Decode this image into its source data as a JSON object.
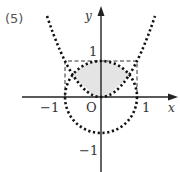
{
  "problem": {
    "number_label": "(5)"
  },
  "axes": {
    "x_label": "x",
    "y_label": "y",
    "origin_label": "O",
    "x_ticks": [
      {
        "value": -1,
        "label": "−1"
      },
      {
        "value": 1,
        "label": "1"
      }
    ],
    "y_ticks": [
      {
        "value": 1,
        "label": "1"
      },
      {
        "value": -1,
        "label": "−1"
      }
    ]
  },
  "curves": [
    {
      "name": "parabola",
      "equation": "y = x^2",
      "style": "dotted",
      "x_range": [
        -1.5,
        1.5
      ]
    },
    {
      "name": "unit-circle",
      "equation": "x^2 + y^2 = 1",
      "style": "dotted"
    }
  ],
  "guide_rectangle": {
    "x_range": [
      -1,
      1
    ],
    "y_range": [
      0,
      1
    ],
    "style": "dashed"
  },
  "shaded_region": {
    "description": "region inside the unit circle and above the parabola y = x^2",
    "color": "#e4e4e4"
  },
  "colors": {
    "stroke": "#222222",
    "shade": "#e4e4e4",
    "text": "#333333"
  },
  "labels": {
    "x_tick_neg1": "−1",
    "x_tick_pos1": "1",
    "y_tick_pos1": "1",
    "y_tick_neg1": "−1"
  }
}
